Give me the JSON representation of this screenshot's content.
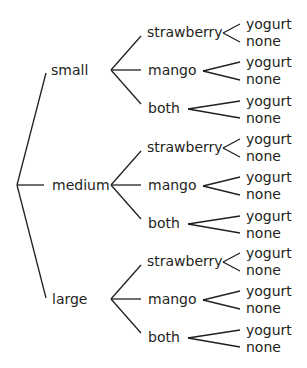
{
  "diagram": {
    "type": "tree",
    "root": "",
    "levels": [
      "size",
      "flavor",
      "topping"
    ],
    "sizes": [
      {
        "label": "small",
        "flavors": [
          {
            "label": "strawberry",
            "toppings": [
              "yogurt",
              "none"
            ]
          },
          {
            "label": "mango",
            "toppings": [
              "yogurt",
              "none"
            ]
          },
          {
            "label": "both",
            "toppings": [
              "yogurt",
              "none"
            ]
          }
        ]
      },
      {
        "label": "medium",
        "flavors": [
          {
            "label": "strawberry",
            "toppings": [
              "yogurt",
              "none"
            ]
          },
          {
            "label": "mango",
            "toppings": [
              "yogurt",
              "none"
            ]
          },
          {
            "label": "both",
            "toppings": [
              "yogurt",
              "none"
            ]
          }
        ]
      },
      {
        "label": "large",
        "flavors": [
          {
            "label": "strawberry",
            "toppings": [
              "yogurt",
              "none"
            ]
          },
          {
            "label": "mango",
            "toppings": [
              "yogurt",
              "none"
            ]
          },
          {
            "label": "both",
            "toppings": [
              "yogurt",
              "none"
            ]
          }
        ]
      }
    ]
  },
  "colors": {
    "ink": "#231f20",
    "background": "#ffffff"
  }
}
